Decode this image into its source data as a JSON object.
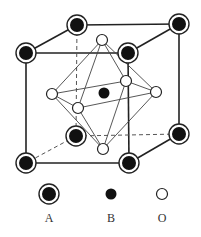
{
  "diagram": {
    "type": "crystal-structure",
    "legend": [
      {
        "symbol": "A",
        "style": "black dot with ring",
        "label": "A"
      },
      {
        "symbol": "B",
        "style": "small black dot",
        "label": "B"
      },
      {
        "symbol": "O",
        "style": "open circle",
        "label": "O"
      }
    ],
    "atoms": {
      "A": [
        {
          "pos": "top-back-left",
          "x": 77,
          "y": 25
        },
        {
          "pos": "top-back-right",
          "x": 179,
          "y": 24
        },
        {
          "pos": "top-front-left",
          "x": 26,
          "y": 53
        },
        {
          "pos": "top-front-right",
          "x": 128,
          "y": 53
        },
        {
          "pos": "bottom-back-left",
          "x": 76,
          "y": 136
        },
        {
          "pos": "bottom-back-right",
          "x": 179,
          "y": 134
        },
        {
          "pos": "bottom-front-left",
          "x": 26,
          "y": 163
        },
        {
          "pos": "bottom-front-right",
          "x": 129,
          "y": 163
        }
      ],
      "B": [
        {
          "pos": "body-center",
          "x": 104,
          "y": 93
        }
      ],
      "O": [
        {
          "pos": "top",
          "x": 102,
          "y": 40
        },
        {
          "pos": "bottom",
          "x": 103,
          "y": 149
        },
        {
          "pos": "left",
          "x": 52,
          "y": 94
        },
        {
          "pos": "right",
          "x": 156,
          "y": 92
        },
        {
          "pos": "front",
          "x": 78,
          "y": 108
        },
        {
          "pos": "back",
          "x": 126,
          "y": 81
        }
      ]
    }
  },
  "labels": {
    "A": "A",
    "B": "B",
    "O": "O"
  }
}
